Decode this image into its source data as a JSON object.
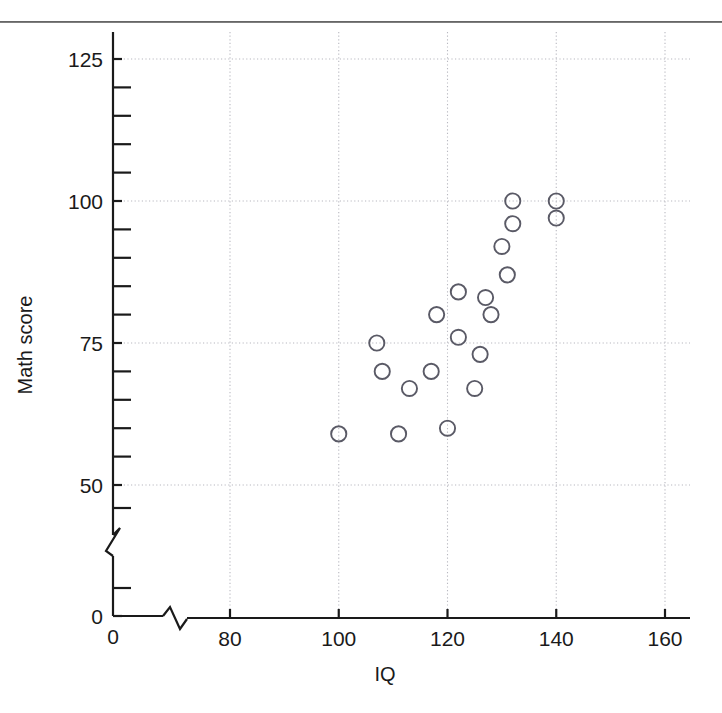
{
  "chart_data": {
    "type": "scatter",
    "title": "",
    "xlabel": "IQ",
    "ylabel": "Math score",
    "xlim": [
      0,
      165
    ],
    "ylim": [
      0,
      130
    ],
    "x_ticks": [
      0,
      80,
      100,
      120,
      140,
      160
    ],
    "x_tick_labels": [
      "0",
      "80",
      "100",
      "120",
      "140",
      "160"
    ],
    "y_ticks": [
      0,
      50,
      75,
      100,
      125
    ],
    "y_tick_labels": [
      "0",
      "50",
      "75",
      "100",
      "125"
    ],
    "y_minor_tick_step": 5,
    "x_axis_break": true,
    "y_axis_break": true,
    "grid": true,
    "grid_style": "dotted",
    "legend": null,
    "marker": "open-circle",
    "marker_color": "#5a5a66",
    "marker_fill": "none",
    "points": [
      {
        "x": 100,
        "y": 59
      },
      {
        "x": 107,
        "y": 75
      },
      {
        "x": 108,
        "y": 70
      },
      {
        "x": 111,
        "y": 59
      },
      {
        "x": 113,
        "y": 67
      },
      {
        "x": 117,
        "y": 70
      },
      {
        "x": 118,
        "y": 80
      },
      {
        "x": 120,
        "y": 60
      },
      {
        "x": 122,
        "y": 84
      },
      {
        "x": 122,
        "y": 76
      },
      {
        "x": 125,
        "y": 67
      },
      {
        "x": 126,
        "y": 73
      },
      {
        "x": 127,
        "y": 83
      },
      {
        "x": 128,
        "y": 80
      },
      {
        "x": 130,
        "y": 92
      },
      {
        "x": 131,
        "y": 87
      },
      {
        "x": 132,
        "y": 96
      },
      {
        "x": 132,
        "y": 100
      },
      {
        "x": 140,
        "y": 97
      },
      {
        "x": 140,
        "y": 100
      }
    ]
  },
  "axes": {
    "x_title": "IQ",
    "y_title": "Math score"
  },
  "colors": {
    "axis": "#1a1a1a",
    "grid": "#b8b8c0",
    "marker": "#5a5a66",
    "rule": "#5a5a5a"
  }
}
